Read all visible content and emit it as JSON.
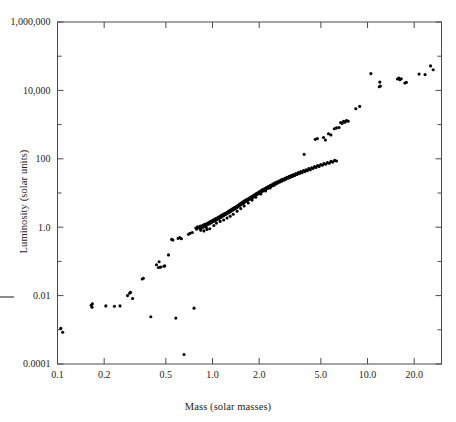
{
  "figure": {
    "title": "",
    "x_axis_title": "Mass (solar masses)",
    "y_axis_title": "Luminosity (solar units)"
  },
  "chart_data": {
    "type": "scatter",
    "title": "",
    "xlabel": "Mass (solar masses)",
    "ylabel": "Luminosity (solar units)",
    "xscale": "log",
    "yscale": "log",
    "xlim": [
      0.1,
      30.0
    ],
    "ylim": [
      0.0001,
      1000000
    ],
    "grid": false,
    "legend": null,
    "marker": "filled-circle",
    "marker_color": "#000000",
    "marker_size_px": 3.1,
    "xticks": [
      0.1,
      0.2,
      0.5,
      1.0,
      2.0,
      5.0,
      10.0,
      20.0
    ],
    "xticklabels": [
      "0.1",
      "0.2",
      "0.5",
      "1.0",
      "2.0",
      "5.0",
      "10.0",
      "20.0"
    ],
    "yticks": [
      0.0001,
      0.01,
      1.0,
      100,
      10000,
      1000000
    ],
    "yticklabels": [
      "0.0001",
      "0.01",
      "1.0",
      "100",
      "10,000",
      "1,000,000"
    ],
    "y_minor_ticks": [
      0.001,
      0.1,
      10,
      1000,
      100000
    ],
    "points": [
      [
        0.105,
        0.0011
      ],
      [
        0.108,
        0.00085
      ],
      [
        0.165,
        0.0052
      ],
      [
        0.168,
        0.0058
      ],
      [
        0.167,
        0.0046
      ],
      [
        0.205,
        0.005
      ],
      [
        0.233,
        0.0049
      ],
      [
        0.253,
        0.005
      ],
      [
        0.283,
        0.01
      ],
      [
        0.292,
        0.0118
      ],
      [
        0.296,
        0.0125
      ],
      [
        0.305,
        0.0082
      ],
      [
        0.352,
        0.0305
      ],
      [
        0.358,
        0.032
      ],
      [
        0.4,
        0.0024
      ],
      [
        0.435,
        0.08
      ],
      [
        0.452,
        0.098
      ],
      [
        0.448,
        0.066
      ],
      [
        0.462,
        0.068
      ],
      [
        0.485,
        0.072
      ],
      [
        0.492,
        0.074
      ],
      [
        0.52,
        0.155
      ],
      [
        0.545,
        0.44
      ],
      [
        0.555,
        0.42
      ],
      [
        0.58,
        0.0022
      ],
      [
        0.6,
        0.47
      ],
      [
        0.615,
        0.5
      ],
      [
        0.63,
        0.46
      ],
      [
        0.655,
        0.00019
      ],
      [
        0.7,
        0.62
      ],
      [
        0.715,
        0.66
      ],
      [
        0.74,
        0.7
      ],
      [
        0.76,
        0.0043
      ],
      [
        0.78,
        0.95
      ],
      [
        0.79,
        0.88
      ],
      [
        0.8,
        1.02
      ],
      [
        0.815,
        1.0
      ],
      [
        0.825,
        0.93
      ],
      [
        0.835,
        1.08
      ],
      [
        0.845,
        1.05
      ],
      [
        0.855,
        0.97
      ],
      [
        0.862,
        1.12
      ],
      [
        0.87,
        1.0
      ],
      [
        0.878,
        1.18
      ],
      [
        0.885,
        1.06
      ],
      [
        0.895,
        1.22
      ],
      [
        0.905,
        1.15
      ],
      [
        0.912,
        0.99
      ],
      [
        0.92,
        1.28
      ],
      [
        0.93,
        1.2
      ],
      [
        0.94,
        1.35
      ],
      [
        0.95,
        1.25
      ],
      [
        0.958,
        1.42
      ],
      [
        0.966,
        1.3
      ],
      [
        0.975,
        1.48
      ],
      [
        0.985,
        1.38
      ],
      [
        0.992,
        1.55
      ],
      [
        1.0,
        1.45
      ],
      [
        1.01,
        1.62
      ],
      [
        1.02,
        1.5
      ],
      [
        1.03,
        1.7
      ],
      [
        1.04,
        1.58
      ],
      [
        1.05,
        1.78
      ],
      [
        1.06,
        1.66
      ],
      [
        1.07,
        1.85
      ],
      [
        1.08,
        1.72
      ],
      [
        1.09,
        1.95
      ],
      [
        1.1,
        1.8
      ],
      [
        1.11,
        2.05
      ],
      [
        1.12,
        1.9
      ],
      [
        1.13,
        2.15
      ],
      [
        1.14,
        2.0
      ],
      [
        1.15,
        2.25
      ],
      [
        1.16,
        2.1
      ],
      [
        1.17,
        2.35
      ],
      [
        1.18,
        2.2
      ],
      [
        1.19,
        2.45
      ],
      [
        1.2,
        2.3
      ],
      [
        1.21,
        2.55
      ],
      [
        1.22,
        2.4
      ],
      [
        1.23,
        2.65
      ],
      [
        1.24,
        2.5
      ],
      [
        1.25,
        2.78
      ],
      [
        1.26,
        2.6
      ],
      [
        1.27,
        2.9
      ],
      [
        1.28,
        2.72
      ],
      [
        1.29,
        3.05
      ],
      [
        1.3,
        2.85
      ],
      [
        1.31,
        3.18
      ],
      [
        1.32,
        3.0
      ],
      [
        1.33,
        3.32
      ],
      [
        1.34,
        3.12
      ],
      [
        1.35,
        3.45
      ],
      [
        1.36,
        3.25
      ],
      [
        1.37,
        3.6
      ],
      [
        1.38,
        3.38
      ],
      [
        1.39,
        3.75
      ],
      [
        1.4,
        3.52
      ],
      [
        1.41,
        3.9
      ],
      [
        1.42,
        3.68
      ],
      [
        1.43,
        4.05
      ],
      [
        1.44,
        3.82
      ],
      [
        1.45,
        4.25
      ],
      [
        1.46,
        4.0
      ],
      [
        1.47,
        4.45
      ],
      [
        1.48,
        4.18
      ],
      [
        1.49,
        4.65
      ],
      [
        1.5,
        4.35
      ],
      [
        1.51,
        4.85
      ],
      [
        1.52,
        4.55
      ],
      [
        1.53,
        5.05
      ],
      [
        1.545,
        4.75
      ],
      [
        1.555,
        5.3
      ],
      [
        1.565,
        4.95
      ],
      [
        1.575,
        5.55
      ],
      [
        1.59,
        5.2
      ],
      [
        1.6,
        5.8
      ],
      [
        1.615,
        5.45
      ],
      [
        1.63,
        6.1
      ],
      [
        1.645,
        5.7
      ],
      [
        1.66,
        6.4
      ],
      [
        1.675,
        6.0
      ],
      [
        1.69,
        6.7
      ],
      [
        1.705,
        6.3
      ],
      [
        1.72,
        7.05
      ],
      [
        1.735,
        6.6
      ],
      [
        1.75,
        7.4
      ],
      [
        1.765,
        6.95
      ],
      [
        1.78,
        7.8
      ],
      [
        1.8,
        7.3
      ],
      [
        1.815,
        8.2
      ],
      [
        1.83,
        7.7
      ],
      [
        1.85,
        8.6
      ],
      [
        1.865,
        8.1
      ],
      [
        1.885,
        9.1
      ],
      [
        1.9,
        8.5
      ],
      [
        1.92,
        9.6
      ],
      [
        1.94,
        9.0
      ],
      [
        1.96,
        10.2
      ],
      [
        1.98,
        9.5
      ],
      [
        2.0,
        10.8
      ],
      [
        2.02,
        10.1
      ],
      [
        2.04,
        11.4
      ],
      [
        2.06,
        10.7
      ],
      [
        2.08,
        12.1
      ],
      [
        2.1,
        11.3
      ],
      [
        2.13,
        12.8
      ],
      [
        2.15,
        12.0
      ],
      [
        2.18,
        13.6
      ],
      [
        2.2,
        12.7
      ],
      [
        2.23,
        14.5
      ],
      [
        2.26,
        13.5
      ],
      [
        2.29,
        15.4
      ],
      [
        2.32,
        14.4
      ],
      [
        2.35,
        16.4
      ],
      [
        2.38,
        15.3
      ],
      [
        2.41,
        17.5
      ],
      [
        2.44,
        16.3
      ],
      [
        2.47,
        18.6
      ],
      [
        2.5,
        17.4
      ],
      [
        2.53,
        19.8
      ],
      [
        2.57,
        18.5
      ],
      [
        2.6,
        21.0
      ],
      [
        2.64,
        19.7
      ],
      [
        2.68,
        22.4
      ],
      [
        2.72,
        21.0
      ],
      [
        2.76,
        23.8
      ],
      [
        2.8,
        22.3
      ],
      [
        2.84,
        25.3
      ],
      [
        2.88,
        23.7
      ],
      [
        2.93,
        27.0
      ],
      [
        2.97,
        25.2
      ],
      [
        3.02,
        28.8
      ],
      [
        3.07,
        27.0
      ],
      [
        3.12,
        30.6
      ],
      [
        3.17,
        28.7
      ],
      [
        3.22,
        32.6
      ],
      [
        3.28,
        30.5
      ],
      [
        3.33,
        34.8
      ],
      [
        3.39,
        32.5
      ],
      [
        3.45,
        37.0
      ],
      [
        3.51,
        34.7
      ],
      [
        3.58,
        39.5
      ],
      [
        3.64,
        37.0
      ],
      [
        3.71,
        42.1
      ],
      [
        3.78,
        39.4
      ],
      [
        3.86,
        45.0
      ],
      [
        3.93,
        42.0
      ],
      [
        4.01,
        48.0
      ],
      [
        4.09,
        45.0
      ],
      [
        4.18,
        51.5
      ],
      [
        4.27,
        48.0
      ],
      [
        4.36,
        55.0
      ],
      [
        4.45,
        52.0
      ],
      [
        4.55,
        59.0
      ],
      [
        4.65,
        56.0
      ],
      [
        4.76,
        63.5
      ],
      [
        4.87,
        60.0
      ],
      [
        4.99,
        68.0
      ],
      [
        5.11,
        64.5
      ],
      [
        5.24,
        73.0
      ],
      [
        5.37,
        69.0
      ],
      [
        5.51,
        78.0
      ],
      [
        5.66,
        74.0
      ],
      [
        5.81,
        84.0
      ],
      [
        5.97,
        80.0
      ],
      [
        6.14,
        90.0
      ],
      [
        6.31,
        86.0
      ],
      [
        3.9,
        135.0
      ],
      [
        4.6,
        370.0
      ],
      [
        4.75,
        390.0
      ],
      [
        5.2,
        420.0
      ],
      [
        5.35,
        355.0
      ],
      [
        5.6,
        540.0
      ],
      [
        5.8,
        500.0
      ],
      [
        6.1,
        760.0
      ],
      [
        6.3,
        800.0
      ],
      [
        6.55,
        820.0
      ],
      [
        6.7,
        1150.0
      ],
      [
        6.85,
        1080.0
      ],
      [
        7.0,
        1250.0
      ],
      [
        7.15,
        1180.0
      ],
      [
        7.3,
        1320.0
      ],
      [
        7.5,
        1260.0
      ],
      [
        8.4,
        2900.0
      ],
      [
        8.9,
        3400.0
      ],
      [
        10.5,
        31000.0
      ],
      [
        11.9,
        12800.0
      ],
      [
        12.1,
        13500.0
      ],
      [
        12.0,
        17500.0
      ],
      [
        15.6,
        21500.0
      ],
      [
        15.9,
        23000.0
      ],
      [
        16.2,
        20500.0
      ],
      [
        16.5,
        22000.0
      ],
      [
        17.4,
        16500.0
      ],
      [
        17.8,
        17200.0
      ],
      [
        21.5,
        30000.0
      ],
      [
        23.5,
        29000.0
      ],
      [
        25.5,
        52000.0
      ],
      [
        26.5,
        40000.0
      ],
      [
        0.9,
        1.05
      ],
      [
        1.02,
        1.12
      ],
      [
        0.96,
        0.9
      ],
      [
        1.06,
        1.32
      ],
      [
        1.12,
        1.48
      ],
      [
        1.18,
        1.62
      ],
      [
        1.24,
        1.85
      ],
      [
        1.3,
        2.1
      ],
      [
        1.36,
        2.4
      ],
      [
        1.44,
        2.95
      ],
      [
        1.52,
        3.5
      ],
      [
        1.6,
        4.2
      ],
      [
        1.7,
        5.1
      ],
      [
        1.8,
        6.2
      ],
      [
        1.9,
        7.5
      ],
      [
        2.05,
        9.4
      ],
      [
        2.2,
        11.5
      ],
      [
        2.35,
        14.0
      ],
      [
        2.5,
        17.0
      ],
      [
        2.65,
        20.5
      ],
      [
        2.8,
        24.5
      ],
      [
        0.84,
        0.82
      ],
      [
        0.88,
        0.78
      ],
      [
        0.92,
        0.86
      ]
    ]
  }
}
